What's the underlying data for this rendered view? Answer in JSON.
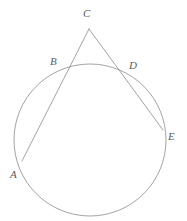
{
  "figure": {
    "background_color": "#ffffff",
    "stroke_color": "#8c8c8c",
    "label_color": "#5a5a5a",
    "stroke_width": 0.8,
    "width": 187,
    "height": 221
  },
  "circle": {
    "name": "circle",
    "cx": 90,
    "cy": 140,
    "r": 76
  },
  "points": [
    {
      "id": "A",
      "label": "A",
      "x": 22,
      "y": 161,
      "label_x": 10,
      "label_y": 169,
      "on_circle": true
    },
    {
      "id": "B",
      "label": "B",
      "x": 67,
      "y": 70,
      "label_x": 50,
      "label_y": 56,
      "on_circle": true
    },
    {
      "id": "C",
      "label": "C",
      "x": 89,
      "y": 29,
      "label_x": 83,
      "label_y": 8,
      "on_circle": false
    },
    {
      "id": "D",
      "label": "D",
      "x": 126,
      "y": 73,
      "label_x": 129,
      "label_y": 60,
      "on_circle": true
    },
    {
      "id": "E",
      "label": "E",
      "x": 163,
      "y": 130,
      "label_x": 168,
      "label_y": 131,
      "on_circle": true
    }
  ],
  "segments": [
    {
      "id": "CA",
      "name": "secant-c-a",
      "from": "C",
      "to": "A",
      "x1": 89,
      "y1": 29,
      "x2": 22,
      "y2": 161
    },
    {
      "id": "CE",
      "name": "secant-c-e",
      "from": "C",
      "to": "E",
      "x1": 89,
      "y1": 29,
      "x2": 163,
      "y2": 130
    }
  ],
  "chart_data": {
    "type": "diagram",
    "shapes": [
      {
        "kind": "circle",
        "center": [
          90,
          140
        ],
        "radius": 76
      },
      {
        "kind": "line",
        "points": [
          [
            89,
            29
          ],
          [
            22,
            161
          ]
        ],
        "labelled_points": [
          "C",
          "B",
          "A"
        ]
      },
      {
        "kind": "line",
        "points": [
          [
            89,
            29
          ],
          [
            163,
            130
          ]
        ],
        "labelled_points": [
          "C",
          "D",
          "E"
        ]
      }
    ],
    "labels": [
      "A",
      "B",
      "C",
      "D",
      "E"
    ]
  }
}
